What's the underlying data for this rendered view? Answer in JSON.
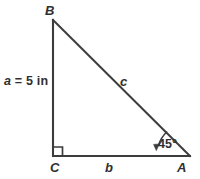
{
  "figure": {
    "background_color": "#ffffff",
    "stroke_color": "#3c3c3c",
    "text_color": "#2f2f2f",
    "width": 200,
    "height": 179,
    "vertices": [
      {
        "name": "B",
        "label": "B",
        "x": 53,
        "y": 20
      },
      {
        "name": "C",
        "label": "C",
        "x": 53,
        "y": 156
      },
      {
        "name": "A",
        "label": "A",
        "x": 190,
        "y": 156
      }
    ],
    "sides": [
      {
        "name": "a",
        "label": "a",
        "from": "B",
        "to": "C",
        "measure_text": "a = 5 in",
        "value": 5,
        "unit": "in",
        "variable": "a"
      },
      {
        "name": "b",
        "label": "b",
        "from": "C",
        "to": "A",
        "measure_text": "",
        "value": null,
        "unit": "",
        "variable": "b"
      },
      {
        "name": "c",
        "label": "c",
        "from": "A",
        "to": "B",
        "measure_text": "",
        "value": null,
        "unit": "",
        "variable": "c"
      }
    ],
    "angles": [
      {
        "at": "C",
        "type": "right-angle",
        "marker": "square",
        "label": ""
      },
      {
        "at": "A",
        "type": "arc-with-arrow",
        "marker": "arc",
        "label": "45°",
        "value": 45,
        "unit": "degrees"
      }
    ],
    "labels": {
      "vertex_B": "B",
      "vertex_C": "C",
      "vertex_A": "A",
      "side_a_text_prefix": "a",
      "side_a_text_rest": " = 5 in",
      "side_b": "b",
      "side_c": "c",
      "angle_A": "45°"
    }
  }
}
